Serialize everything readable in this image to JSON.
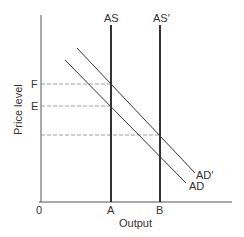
{
  "diagram": {
    "type": "AS-AD model",
    "axes": {
      "y_label": "Price level",
      "x_label": "Output",
      "origin_label": "0"
    },
    "curves": {
      "as_label": "AS",
      "as_prime_label": "AS′",
      "ad_label": "AD",
      "ad_prime_label": "AD′"
    },
    "price_levels": {
      "f_label": "F",
      "e_label": "E"
    },
    "output_levels": {
      "a_label": "A",
      "b_label": "B"
    },
    "colors": {
      "line": "#333333",
      "dashed": "#888888",
      "background": "#ffffff"
    }
  }
}
